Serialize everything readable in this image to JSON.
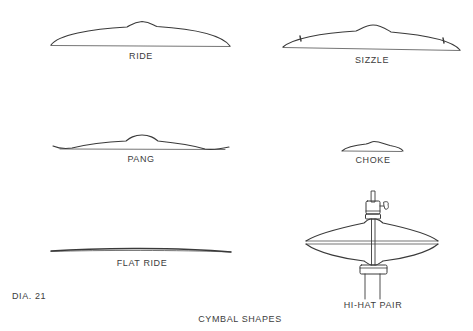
{
  "diagram": {
    "figure_id": "DIA. 21",
    "caption": "CYMBAL SHAPES",
    "stroke_color": "#3a3a3a",
    "cymbals": [
      {
        "id": "ride",
        "label": "RIDE"
      },
      {
        "id": "sizzle",
        "label": "SIZZLE"
      },
      {
        "id": "pang",
        "label": "PANG"
      },
      {
        "id": "choke",
        "label": "CHOKE"
      },
      {
        "id": "flat-ride",
        "label": "FLAT RIDE"
      },
      {
        "id": "hi-hat-pair",
        "label": "HI-HAT PAIR"
      }
    ]
  }
}
